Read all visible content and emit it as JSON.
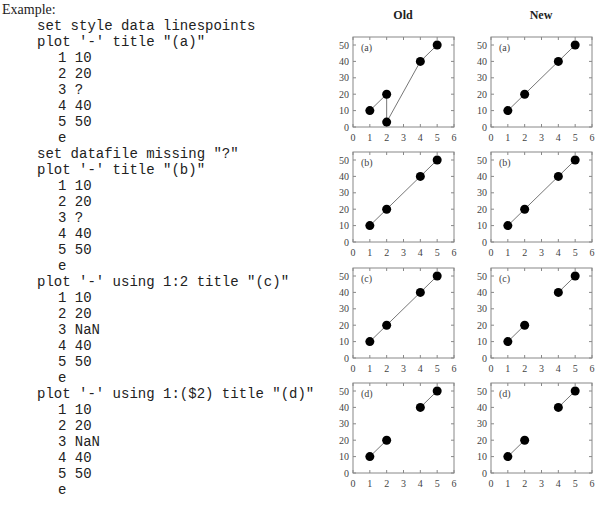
{
  "example_label": "Example:",
  "code_lines": [
    {
      "text": "set style data linespoints",
      "indent": 1
    },
    {
      "text": "plot '-' title \"(a)\"",
      "indent": 1
    },
    {
      "text": "1 10",
      "indent": 2
    },
    {
      "text": "2 20",
      "indent": 2
    },
    {
      "text": "3 ?",
      "indent": 2
    },
    {
      "text": "4 40",
      "indent": 2
    },
    {
      "text": "5 50",
      "indent": 2
    },
    {
      "text": "e",
      "indent": 2
    },
    {
      "text": "set datafile missing \"?\"",
      "indent": 1
    },
    {
      "text": "plot '-' title \"(b)\"",
      "indent": 1
    },
    {
      "text": "1 10",
      "indent": 2
    },
    {
      "text": "2 20",
      "indent": 2
    },
    {
      "text": "3 ?",
      "indent": 2
    },
    {
      "text": "4 40",
      "indent": 2
    },
    {
      "text": "5 50",
      "indent": 2
    },
    {
      "text": "e",
      "indent": 2
    },
    {
      "text": "plot '-' using 1:2 title \"(c)\"",
      "indent": 1
    },
    {
      "text": "1 10",
      "indent": 2
    },
    {
      "text": "2 20",
      "indent": 2
    },
    {
      "text": "3 NaN",
      "indent": 2
    },
    {
      "text": "4 40",
      "indent": 2
    },
    {
      "text": "5 50",
      "indent": 2
    },
    {
      "text": "e",
      "indent": 2
    },
    {
      "text": "plot '-' using 1:($2) title \"(d)\"",
      "indent": 1
    },
    {
      "text": "1 10",
      "indent": 2
    },
    {
      "text": "2 20",
      "indent": 2
    },
    {
      "text": "3 NaN",
      "indent": 2
    },
    {
      "text": "4 40",
      "indent": 2
    },
    {
      "text": "5 50",
      "indent": 2
    },
    {
      "text": "e",
      "indent": 2
    }
  ],
  "columns": {
    "old": "Old",
    "new": "New"
  },
  "chart_data": [
    {
      "type": "line",
      "column": "Old",
      "label": "(a)",
      "xlim": [
        0,
        6
      ],
      "ylim": [
        0,
        50
      ],
      "xticks": [
        0,
        1,
        2,
        3,
        4,
        5,
        6
      ],
      "yticks": [
        0,
        10,
        20,
        30,
        40,
        50
      ],
      "segments": [
        [
          [
            1,
            10
          ],
          [
            2,
            20
          ],
          [
            2,
            3
          ],
          [
            4,
            40
          ],
          [
            5,
            50
          ]
        ]
      ]
    },
    {
      "type": "line",
      "column": "New",
      "label": "(a)",
      "xlim": [
        0,
        6
      ],
      "ylim": [
        0,
        50
      ],
      "xticks": [
        0,
        1,
        2,
        3,
        4,
        5,
        6
      ],
      "yticks": [
        0,
        10,
        20,
        30,
        40,
        50
      ],
      "segments": [
        [
          [
            1,
            10
          ],
          [
            2,
            20
          ],
          [
            4,
            40
          ],
          [
            5,
            50
          ]
        ]
      ]
    },
    {
      "type": "line",
      "column": "Old",
      "label": "(b)",
      "xlim": [
        0,
        6
      ],
      "ylim": [
        0,
        50
      ],
      "xticks": [
        0,
        1,
        2,
        3,
        4,
        5,
        6
      ],
      "yticks": [
        0,
        10,
        20,
        30,
        40,
        50
      ],
      "segments": [
        [
          [
            1,
            10
          ],
          [
            2,
            20
          ],
          [
            4,
            40
          ],
          [
            5,
            50
          ]
        ]
      ]
    },
    {
      "type": "line",
      "column": "New",
      "label": "(b)",
      "xlim": [
        0,
        6
      ],
      "ylim": [
        0,
        50
      ],
      "xticks": [
        0,
        1,
        2,
        3,
        4,
        5,
        6
      ],
      "yticks": [
        0,
        10,
        20,
        30,
        40,
        50
      ],
      "segments": [
        [
          [
            1,
            10
          ],
          [
            2,
            20
          ],
          [
            4,
            40
          ],
          [
            5,
            50
          ]
        ]
      ]
    },
    {
      "type": "line",
      "column": "Old",
      "label": "(c)",
      "xlim": [
        0,
        6
      ],
      "ylim": [
        0,
        50
      ],
      "xticks": [
        0,
        1,
        2,
        3,
        4,
        5,
        6
      ],
      "yticks": [
        0,
        10,
        20,
        30,
        40,
        50
      ],
      "segments": [
        [
          [
            1,
            10
          ],
          [
            2,
            20
          ],
          [
            4,
            40
          ],
          [
            5,
            50
          ]
        ]
      ]
    },
    {
      "type": "line",
      "column": "New",
      "label": "(c)",
      "xlim": [
        0,
        6
      ],
      "ylim": [
        0,
        50
      ],
      "xticks": [
        0,
        1,
        2,
        3,
        4,
        5,
        6
      ],
      "yticks": [
        0,
        10,
        20,
        30,
        40,
        50
      ],
      "segments": [
        [
          [
            1,
            10
          ],
          [
            2,
            20
          ]
        ],
        [
          [
            4,
            40
          ],
          [
            5,
            50
          ]
        ]
      ]
    },
    {
      "type": "line",
      "column": "Old",
      "label": "(d)",
      "xlim": [
        0,
        6
      ],
      "ylim": [
        0,
        50
      ],
      "xticks": [
        0,
        1,
        2,
        3,
        4,
        5,
        6
      ],
      "yticks": [
        0,
        10,
        20,
        30,
        40,
        50
      ],
      "segments": [
        [
          [
            1,
            10
          ],
          [
            2,
            20
          ]
        ],
        [
          [
            4,
            40
          ],
          [
            5,
            50
          ]
        ]
      ]
    },
    {
      "type": "line",
      "column": "New",
      "label": "(d)",
      "xlim": [
        0,
        6
      ],
      "ylim": [
        0,
        50
      ],
      "xticks": [
        0,
        1,
        2,
        3,
        4,
        5,
        6
      ],
      "yticks": [
        0,
        10,
        20,
        30,
        40,
        50
      ],
      "segments": [
        [
          [
            1,
            10
          ],
          [
            2,
            20
          ]
        ],
        [
          [
            4,
            40
          ],
          [
            5,
            50
          ]
        ]
      ]
    }
  ]
}
